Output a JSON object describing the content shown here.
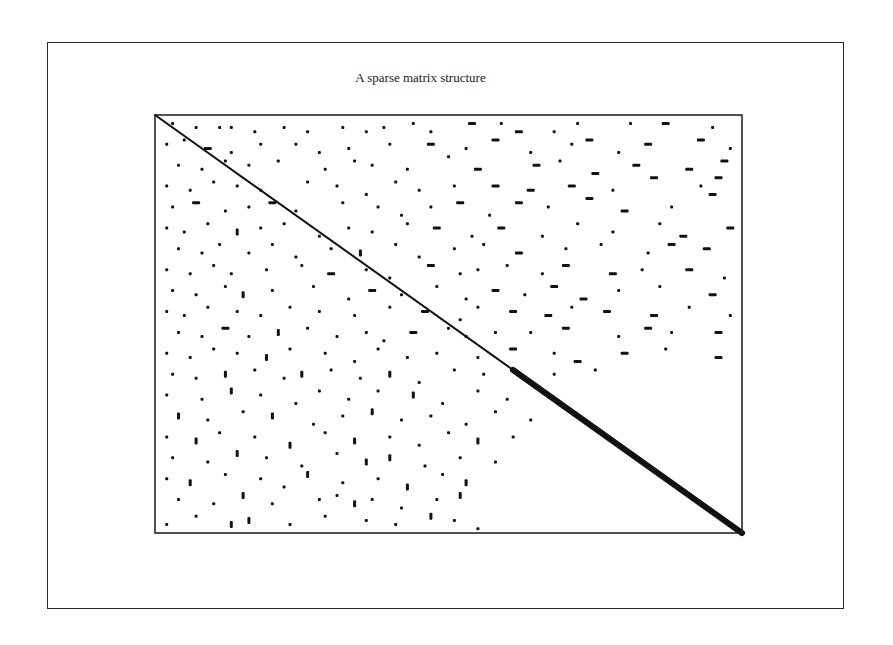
{
  "figure": {
    "title": "A sparse matrix structure",
    "outer_frame": {
      "x": 47,
      "y": 42,
      "w": 797,
      "h": 567
    },
    "plot_frame": {
      "x": 155,
      "y": 115,
      "w": 587,
      "h": 418
    },
    "ink_color": "#111111"
  },
  "chart_data": {
    "type": "scatter",
    "title": "A sparse matrix structure",
    "xlabel": "",
    "ylabel": "",
    "axes": {
      "ticks": false,
      "grid": false,
      "legend": false,
      "frame": true
    },
    "coordinate_note": "Points given in normalized matrix coordinates: col and row in [0,1], origin top-left; len = run length (normalized), dir = h (horizontal run) or v (vertical run) or d (dot).",
    "diagonal": {
      "from": [
        0,
        0
      ],
      "to": [
        1,
        1
      ],
      "thin_until": 0.61,
      "thick_from": 0.61,
      "thin_width": 2,
      "thick_width": 6
    },
    "points": [
      [
        0.03,
        0.02,
        "d"
      ],
      [
        0.07,
        0.03,
        "d"
      ],
      [
        0.11,
        0.03,
        "d"
      ],
      [
        0.13,
        0.03,
        "d"
      ],
      [
        0.17,
        0.04,
        "d"
      ],
      [
        0.22,
        0.03,
        "d"
      ],
      [
        0.26,
        0.04,
        "d"
      ],
      [
        0.32,
        0.03,
        "d"
      ],
      [
        0.36,
        0.04,
        "d"
      ],
      [
        0.39,
        0.03,
        "d"
      ],
      [
        0.44,
        0.02,
        "d"
      ],
      [
        0.47,
        0.04,
        "d"
      ],
      [
        0.54,
        0.02,
        "h"
      ],
      [
        0.59,
        0.02,
        "d"
      ],
      [
        0.62,
        0.04,
        "h"
      ],
      [
        0.68,
        0.04,
        "d"
      ],
      [
        0.72,
        0.02,
        "d"
      ],
      [
        0.81,
        0.02,
        "d"
      ],
      [
        0.87,
        0.02,
        "h"
      ],
      [
        0.95,
        0.03,
        "d"
      ],
      [
        0.02,
        0.07,
        "d"
      ],
      [
        0.05,
        0.06,
        "d"
      ],
      [
        0.09,
        0.08,
        "h"
      ],
      [
        0.13,
        0.09,
        "d"
      ],
      [
        0.18,
        0.07,
        "d"
      ],
      [
        0.24,
        0.07,
        "d"
      ],
      [
        0.28,
        0.09,
        "d"
      ],
      [
        0.33,
        0.08,
        "d"
      ],
      [
        0.4,
        0.07,
        "d"
      ],
      [
        0.47,
        0.07,
        "h"
      ],
      [
        0.53,
        0.08,
        "d"
      ],
      [
        0.58,
        0.06,
        "h"
      ],
      [
        0.64,
        0.09,
        "d"
      ],
      [
        0.71,
        0.07,
        "d"
      ],
      [
        0.74,
        0.06,
        "h"
      ],
      [
        0.79,
        0.09,
        "d"
      ],
      [
        0.84,
        0.07,
        "h"
      ],
      [
        0.93,
        0.06,
        "h"
      ],
      [
        0.98,
        0.08,
        "d"
      ],
      [
        0.04,
        0.12,
        "d"
      ],
      [
        0.08,
        0.13,
        "d"
      ],
      [
        0.12,
        0.11,
        "d"
      ],
      [
        0.16,
        0.12,
        "d"
      ],
      [
        0.21,
        0.11,
        "d"
      ],
      [
        0.29,
        0.13,
        "d"
      ],
      [
        0.34,
        0.11,
        "d"
      ],
      [
        0.37,
        0.12,
        "d"
      ],
      [
        0.43,
        0.13,
        "d"
      ],
      [
        0.5,
        0.1,
        "d"
      ],
      [
        0.55,
        0.13,
        "h"
      ],
      [
        0.65,
        0.12,
        "h"
      ],
      [
        0.69,
        0.11,
        "d"
      ],
      [
        0.75,
        0.14,
        "h"
      ],
      [
        0.82,
        0.12,
        "h"
      ],
      [
        0.91,
        0.13,
        "h"
      ],
      [
        0.97,
        0.11,
        "h"
      ],
      [
        0.02,
        0.17,
        "d"
      ],
      [
        0.06,
        0.18,
        "d"
      ],
      [
        0.1,
        0.16,
        "d"
      ],
      [
        0.14,
        0.17,
        "d"
      ],
      [
        0.18,
        0.18,
        "d"
      ],
      [
        0.26,
        0.16,
        "d"
      ],
      [
        0.31,
        0.17,
        "d"
      ],
      [
        0.36,
        0.19,
        "d"
      ],
      [
        0.41,
        0.16,
        "d"
      ],
      [
        0.45,
        0.18,
        "d"
      ],
      [
        0.51,
        0.17,
        "d"
      ],
      [
        0.58,
        0.17,
        "h"
      ],
      [
        0.64,
        0.18,
        "h"
      ],
      [
        0.71,
        0.17,
        "h"
      ],
      [
        0.78,
        0.18,
        "d"
      ],
      [
        0.85,
        0.15,
        "h"
      ],
      [
        0.93,
        0.17,
        "d"
      ],
      [
        0.96,
        0.15,
        "h"
      ],
      [
        0.03,
        0.22,
        "d"
      ],
      [
        0.07,
        0.21,
        "h"
      ],
      [
        0.12,
        0.23,
        "d"
      ],
      [
        0.16,
        0.22,
        "d"
      ],
      [
        0.2,
        0.21,
        "h"
      ],
      [
        0.24,
        0.23,
        "d"
      ],
      [
        0.32,
        0.21,
        "d"
      ],
      [
        0.38,
        0.22,
        "d"
      ],
      [
        0.42,
        0.24,
        "d"
      ],
      [
        0.47,
        0.22,
        "d"
      ],
      [
        0.52,
        0.21,
        "h"
      ],
      [
        0.57,
        0.24,
        "d"
      ],
      [
        0.62,
        0.21,
        "h"
      ],
      [
        0.67,
        0.22,
        "d"
      ],
      [
        0.74,
        0.2,
        "h"
      ],
      [
        0.8,
        0.23,
        "h"
      ],
      [
        0.88,
        0.22,
        "d"
      ],
      [
        0.95,
        0.19,
        "h"
      ],
      [
        0.02,
        0.27,
        "d"
      ],
      [
        0.05,
        0.28,
        "d"
      ],
      [
        0.09,
        0.26,
        "d"
      ],
      [
        0.14,
        0.28,
        "v"
      ],
      [
        0.18,
        0.27,
        "d"
      ],
      [
        0.22,
        0.26,
        "d"
      ],
      [
        0.28,
        0.29,
        "d"
      ],
      [
        0.33,
        0.27,
        "d"
      ],
      [
        0.37,
        0.28,
        "d"
      ],
      [
        0.43,
        0.26,
        "d"
      ],
      [
        0.48,
        0.27,
        "h"
      ],
      [
        0.54,
        0.29,
        "d"
      ],
      [
        0.59,
        0.27,
        "h"
      ],
      [
        0.66,
        0.29,
        "d"
      ],
      [
        0.72,
        0.26,
        "d"
      ],
      [
        0.78,
        0.28,
        "d"
      ],
      [
        0.86,
        0.26,
        "d"
      ],
      [
        0.9,
        0.29,
        "h"
      ],
      [
        0.98,
        0.27,
        "h"
      ],
      [
        0.04,
        0.32,
        "d"
      ],
      [
        0.08,
        0.33,
        "d"
      ],
      [
        0.11,
        0.31,
        "d"
      ],
      [
        0.16,
        0.33,
        "d"
      ],
      [
        0.2,
        0.31,
        "d"
      ],
      [
        0.24,
        0.34,
        "d"
      ],
      [
        0.3,
        0.32,
        "d"
      ],
      [
        0.35,
        0.33,
        "v"
      ],
      [
        0.41,
        0.31,
        "d"
      ],
      [
        0.45,
        0.34,
        "d"
      ],
      [
        0.51,
        0.32,
        "d"
      ],
      [
        0.56,
        0.31,
        "d"
      ],
      [
        0.62,
        0.33,
        "h"
      ],
      [
        0.7,
        0.32,
        "d"
      ],
      [
        0.76,
        0.31,
        "d"
      ],
      [
        0.84,
        0.33,
        "d"
      ],
      [
        0.88,
        0.31,
        "h"
      ],
      [
        0.94,
        0.32,
        "h"
      ],
      [
        0.02,
        0.37,
        "d"
      ],
      [
        0.06,
        0.38,
        "d"
      ],
      [
        0.1,
        0.36,
        "d"
      ],
      [
        0.13,
        0.38,
        "d"
      ],
      [
        0.19,
        0.37,
        "d"
      ],
      [
        0.25,
        0.36,
        "d"
      ],
      [
        0.3,
        0.38,
        "h"
      ],
      [
        0.36,
        0.37,
        "d"
      ],
      [
        0.4,
        0.39,
        "d"
      ],
      [
        0.47,
        0.36,
        "h"
      ],
      [
        0.52,
        0.38,
        "d"
      ],
      [
        0.55,
        0.37,
        "d"
      ],
      [
        0.6,
        0.36,
        "d"
      ],
      [
        0.66,
        0.38,
        "d"
      ],
      [
        0.7,
        0.36,
        "h"
      ],
      [
        0.78,
        0.38,
        "h"
      ],
      [
        0.83,
        0.37,
        "d"
      ],
      [
        0.91,
        0.37,
        "h"
      ],
      [
        0.97,
        0.39,
        "d"
      ],
      [
        0.03,
        0.42,
        "d"
      ],
      [
        0.07,
        0.43,
        "d"
      ],
      [
        0.12,
        0.41,
        "d"
      ],
      [
        0.15,
        0.43,
        "v"
      ],
      [
        0.2,
        0.42,
        "d"
      ],
      [
        0.27,
        0.41,
        "d"
      ],
      [
        0.33,
        0.44,
        "d"
      ],
      [
        0.37,
        0.42,
        "h"
      ],
      [
        0.42,
        0.43,
        "d"
      ],
      [
        0.48,
        0.41,
        "d"
      ],
      [
        0.53,
        0.44,
        "d"
      ],
      [
        0.58,
        0.42,
        "h"
      ],
      [
        0.63,
        0.43,
        "d"
      ],
      [
        0.68,
        0.41,
        "h"
      ],
      [
        0.73,
        0.44,
        "h"
      ],
      [
        0.79,
        0.42,
        "d"
      ],
      [
        0.86,
        0.41,
        "d"
      ],
      [
        0.95,
        0.43,
        "h"
      ],
      [
        0.02,
        0.47,
        "d"
      ],
      [
        0.05,
        0.48,
        "d"
      ],
      [
        0.09,
        0.46,
        "d"
      ],
      [
        0.14,
        0.47,
        "d"
      ],
      [
        0.18,
        0.48,
        "d"
      ],
      [
        0.23,
        0.46,
        "d"
      ],
      [
        0.28,
        0.47,
        "d"
      ],
      [
        0.34,
        0.48,
        "d"
      ],
      [
        0.4,
        0.46,
        "d"
      ],
      [
        0.46,
        0.47,
        "h"
      ],
      [
        0.52,
        0.49,
        "d"
      ],
      [
        0.55,
        0.46,
        "d"
      ],
      [
        0.61,
        0.47,
        "h"
      ],
      [
        0.67,
        0.48,
        "h"
      ],
      [
        0.71,
        0.46,
        "d"
      ],
      [
        0.77,
        0.47,
        "h"
      ],
      [
        0.85,
        0.48,
        "h"
      ],
      [
        0.91,
        0.46,
        "d"
      ],
      [
        0.98,
        0.48,
        "d"
      ],
      [
        0.04,
        0.52,
        "d"
      ],
      [
        0.08,
        0.53,
        "d"
      ],
      [
        0.12,
        0.51,
        "h"
      ],
      [
        0.16,
        0.53,
        "d"
      ],
      [
        0.21,
        0.52,
        "v"
      ],
      [
        0.26,
        0.51,
        "d"
      ],
      [
        0.31,
        0.53,
        "d"
      ],
      [
        0.36,
        0.52,
        "d"
      ],
      [
        0.39,
        0.54,
        "d"
      ],
      [
        0.44,
        0.52,
        "h"
      ],
      [
        0.5,
        0.51,
        "d"
      ],
      [
        0.53,
        0.53,
        "d"
      ],
      [
        0.58,
        0.52,
        "d"
      ],
      [
        0.64,
        0.52,
        "d"
      ],
      [
        0.7,
        0.51,
        "h"
      ],
      [
        0.79,
        0.53,
        "d"
      ],
      [
        0.84,
        0.51,
        "h"
      ],
      [
        0.88,
        0.52,
        "d"
      ],
      [
        0.96,
        0.52,
        "h"
      ],
      [
        0.02,
        0.57,
        "d"
      ],
      [
        0.06,
        0.58,
        "d"
      ],
      [
        0.1,
        0.56,
        "d"
      ],
      [
        0.14,
        0.57,
        "d"
      ],
      [
        0.19,
        0.58,
        "v"
      ],
      [
        0.23,
        0.56,
        "d"
      ],
      [
        0.29,
        0.57,
        "d"
      ],
      [
        0.34,
        0.59,
        "d"
      ],
      [
        0.38,
        0.56,
        "d"
      ],
      [
        0.43,
        0.58,
        "d"
      ],
      [
        0.48,
        0.57,
        "d"
      ],
      [
        0.55,
        0.58,
        "d"
      ],
      [
        0.61,
        0.56,
        "h"
      ],
      [
        0.68,
        0.57,
        "d"
      ],
      [
        0.72,
        0.59,
        "h"
      ],
      [
        0.8,
        0.57,
        "h"
      ],
      [
        0.87,
        0.56,
        "d"
      ],
      [
        0.96,
        0.58,
        "h"
      ],
      [
        0.03,
        0.62,
        "d"
      ],
      [
        0.07,
        0.63,
        "d"
      ],
      [
        0.12,
        0.62,
        "v"
      ],
      [
        0.17,
        0.61,
        "d"
      ],
      [
        0.22,
        0.63,
        "d"
      ],
      [
        0.25,
        0.62,
        "v"
      ],
      [
        0.3,
        0.61,
        "d"
      ],
      [
        0.35,
        0.63,
        "d"
      ],
      [
        0.4,
        0.62,
        "v"
      ],
      [
        0.45,
        0.64,
        "d"
      ],
      [
        0.51,
        0.61,
        "d"
      ],
      [
        0.56,
        0.62,
        "d"
      ],
      [
        0.68,
        0.62,
        "d"
      ],
      [
        0.75,
        0.61,
        "d"
      ],
      [
        0.02,
        0.67,
        "d"
      ],
      [
        0.08,
        0.68,
        "d"
      ],
      [
        0.13,
        0.66,
        "v"
      ],
      [
        0.18,
        0.67,
        "d"
      ],
      [
        0.24,
        0.69,
        "d"
      ],
      [
        0.28,
        0.66,
        "d"
      ],
      [
        0.33,
        0.68,
        "d"
      ],
      [
        0.38,
        0.66,
        "d"
      ],
      [
        0.44,
        0.67,
        "v"
      ],
      [
        0.49,
        0.69,
        "d"
      ],
      [
        0.55,
        0.66,
        "d"
      ],
      [
        0.6,
        0.68,
        "d"
      ],
      [
        0.04,
        0.72,
        "v"
      ],
      [
        0.09,
        0.73,
        "d"
      ],
      [
        0.15,
        0.71,
        "d"
      ],
      [
        0.2,
        0.72,
        "v"
      ],
      [
        0.27,
        0.74,
        "d"
      ],
      [
        0.32,
        0.72,
        "d"
      ],
      [
        0.37,
        0.71,
        "v"
      ],
      [
        0.42,
        0.73,
        "d"
      ],
      [
        0.47,
        0.72,
        "d"
      ],
      [
        0.53,
        0.74,
        "d"
      ],
      [
        0.58,
        0.71,
        "d"
      ],
      [
        0.64,
        0.73,
        "d"
      ],
      [
        0.02,
        0.77,
        "d"
      ],
      [
        0.07,
        0.78,
        "v"
      ],
      [
        0.11,
        0.76,
        "d"
      ],
      [
        0.17,
        0.77,
        "d"
      ],
      [
        0.23,
        0.79,
        "v"
      ],
      [
        0.29,
        0.76,
        "d"
      ],
      [
        0.34,
        0.78,
        "v"
      ],
      [
        0.4,
        0.77,
        "d"
      ],
      [
        0.45,
        0.79,
        "d"
      ],
      [
        0.5,
        0.76,
        "d"
      ],
      [
        0.55,
        0.78,
        "v"
      ],
      [
        0.61,
        0.77,
        "d"
      ],
      [
        0.03,
        0.82,
        "d"
      ],
      [
        0.09,
        0.83,
        "d"
      ],
      [
        0.14,
        0.81,
        "v"
      ],
      [
        0.19,
        0.82,
        "d"
      ],
      [
        0.25,
        0.84,
        "d"
      ],
      [
        0.31,
        0.81,
        "d"
      ],
      [
        0.36,
        0.83,
        "v"
      ],
      [
        0.4,
        0.82,
        "v"
      ],
      [
        0.46,
        0.84,
        "d"
      ],
      [
        0.52,
        0.82,
        "d"
      ],
      [
        0.58,
        0.83,
        "d"
      ],
      [
        0.02,
        0.87,
        "d"
      ],
      [
        0.06,
        0.88,
        "v"
      ],
      [
        0.12,
        0.86,
        "d"
      ],
      [
        0.18,
        0.87,
        "d"
      ],
      [
        0.22,
        0.89,
        "d"
      ],
      [
        0.26,
        0.86,
        "v"
      ],
      [
        0.32,
        0.88,
        "d"
      ],
      [
        0.38,
        0.87,
        "d"
      ],
      [
        0.43,
        0.89,
        "v"
      ],
      [
        0.49,
        0.86,
        "d"
      ],
      [
        0.53,
        0.88,
        "v"
      ],
      [
        0.04,
        0.92,
        "d"
      ],
      [
        0.1,
        0.93,
        "d"
      ],
      [
        0.15,
        0.91,
        "v"
      ],
      [
        0.2,
        0.93,
        "d"
      ],
      [
        0.28,
        0.92,
        "d"
      ],
      [
        0.31,
        0.91,
        "d"
      ],
      [
        0.34,
        0.93,
        "v"
      ],
      [
        0.37,
        0.92,
        "d"
      ],
      [
        0.42,
        0.94,
        "d"
      ],
      [
        0.48,
        0.92,
        "d"
      ],
      [
        0.52,
        0.91,
        "v"
      ],
      [
        0.02,
        0.98,
        "d"
      ],
      [
        0.07,
        0.96,
        "d"
      ],
      [
        0.13,
        0.98,
        "v"
      ],
      [
        0.16,
        0.97,
        "v"
      ],
      [
        0.23,
        0.98,
        "d"
      ],
      [
        0.29,
        0.96,
        "d"
      ],
      [
        0.36,
        0.97,
        "d"
      ],
      [
        0.41,
        0.98,
        "d"
      ],
      [
        0.47,
        0.96,
        "v"
      ],
      [
        0.51,
        0.97,
        "d"
      ],
      [
        0.55,
        0.99,
        "d"
      ]
    ]
  }
}
